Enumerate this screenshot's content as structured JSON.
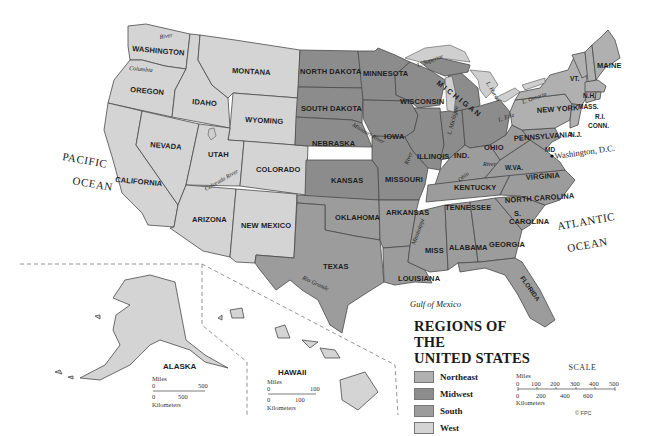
{
  "map": {
    "title_line1": "REGIONS OF THE",
    "title_line2": "UNITED STATES",
    "legend": [
      {
        "label": "Northeast",
        "color": "#b0b0b0"
      },
      {
        "label": "Midwest",
        "color": "#8c8c8c"
      },
      {
        "label": "South",
        "color": "#9c9c9c"
      },
      {
        "label": "West",
        "color": "#d4d4d4"
      }
    ],
    "states": {
      "west": [
        "WASHINGTON",
        "OREGON",
        "CALIFORNIA",
        "IDAHO",
        "NEVADA",
        "MONTANA",
        "WYOMING",
        "UTAH",
        "COLORADO",
        "ARIZONA",
        "NEW MEXICO"
      ],
      "midwest": [
        "NORTH DAKOTA",
        "SOUTH DAKOTA",
        "NEBRASKA",
        "KANSAS",
        "MINNESOTA",
        "IOWA",
        "MISSOURI",
        "WISCONSIN",
        "ILLINOIS",
        "IND.",
        "MICHIGAN",
        "OHIO"
      ],
      "south": [
        "OKLAHOMA",
        "TEXAS",
        "ARKANSAS",
        "LOUISIANA",
        "KENTUCKY",
        "TENNESSEE",
        "MISS",
        "ALABAMA",
        "GEORGIA",
        "FLORIDA",
        "S. CAROLINA",
        "NORTH CAROLINA",
        "VIRGINIA",
        "W.VA.",
        "MD"
      ],
      "northeast": [
        "PENNSYLVANIA",
        "NEW YORK",
        "VT.",
        "N.H.",
        "MAINE",
        "MASS.",
        "R.I.",
        "CONN.",
        "N.J."
      ]
    },
    "labels": {
      "washington": "WASHINGTON",
      "oregon": "OREGON",
      "california": "CALIFORNIA",
      "idaho": "IDAHO",
      "nevada": "NEVADA",
      "montana": "MONTANA",
      "wyoming": "WYOMING",
      "utah": "UTAH",
      "colorado": "COLORADO",
      "arizona": "ARIZONA",
      "new_mexico": "NEW MEXICO",
      "north_dakota": "NORTH DAKOTA",
      "south_dakota": "SOUTH DAKOTA",
      "nebraska": "NEBRASKA",
      "kansas": "KANSAS",
      "minnesota": "MINNESOTA",
      "iowa": "IOWA",
      "missouri": "MISSOURI",
      "wisconsin": "WISCONSIN",
      "illinois": "ILLINOIS",
      "indiana": "IND.",
      "michigan": "M I C H I G A N",
      "ohio": "OHIO",
      "oklahoma": "OKLAHOMA",
      "texas": "TEXAS",
      "arkansas": "ARKANSAS",
      "louisiana": "LOUISIANA",
      "kentucky": "KENTUCKY",
      "tennessee": "TENNESSEE",
      "mississippi": "MISS",
      "alabama": "ALABAMA",
      "georgia": "GEORGIA",
      "florida": "FLORIDA",
      "s_carolina_1": "S.",
      "s_carolina_2": "CAROLINA",
      "north_carolina": "NORTH CAROLINA",
      "virginia": "VIRGINIA",
      "west_virginia": "W.VA.",
      "maryland": "MD",
      "pennsylvania": "PENNSYLVANIA",
      "new_york": "NEW YORK",
      "vermont": "VT.",
      "new_hampshire": "N.H.",
      "maine": "MAINE",
      "massachusetts": "MASS.",
      "rhode_island": "R.I.",
      "connecticut": "CONN.",
      "new_jersey": "N.J.",
      "washington_dc": "Washington, D.C.",
      "dc_marker": "D.C."
    },
    "water": {
      "pacific_1": "PACIFIC",
      "pacific_2": "OCEAN",
      "atlantic_1": "ATLANTIC",
      "atlantic_2": "OCEAN",
      "gulf": "Gulf of Mexico",
      "l_superior": "L. Superior",
      "l_michigan": "L. Michigan",
      "l_huron": "L. Huron",
      "l_erie": "L. Erie",
      "l_ontario": "L. Ontario"
    },
    "rivers": {
      "snake": "River",
      "columbia": "Columbia",
      "colorado": "Colorado River",
      "missouri": "Missouri River",
      "mississippi": "Mississippi",
      "mississippi_upper": "River",
      "ohio": "Ohio",
      "ohio_river": "River",
      "rio_grande": "Rio Grande"
    },
    "insets": {
      "alaska": {
        "title": "ALASKA",
        "miles_label": "Miles",
        "miles_ticks": [
          "0",
          "500"
        ],
        "km_ticks": [
          "0",
          "500"
        ],
        "km_label": "Kilometers"
      },
      "hawaii": {
        "title": "HAWAII",
        "miles_label": "Miles",
        "miles_ticks": [
          "0",
          "100"
        ],
        "km_ticks": [
          "0",
          "100"
        ],
        "km_label": "Kilometers"
      }
    },
    "scale": {
      "title": "SCALE",
      "miles_label": "Miles",
      "miles_ticks": [
        "0",
        "100",
        "200",
        "300",
        "400",
        "500"
      ],
      "km_ticks": [
        "0",
        "200",
        "400",
        "600"
      ],
      "km_label": "Kilometers"
    },
    "copyright": "© FPC"
  }
}
